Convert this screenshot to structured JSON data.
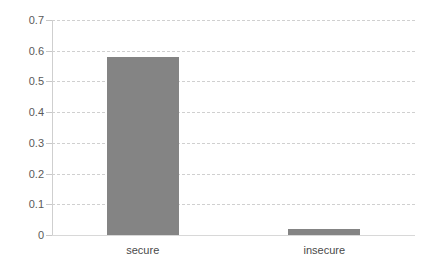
{
  "chart_data": {
    "type": "bar",
    "title": "",
    "subtitle": "",
    "xlabel": "",
    "ylabel": "",
    "categories": [
      "secure",
      "insecure"
    ],
    "values": [
      0.58,
      0.02
    ],
    "series": [
      {
        "name": "proportion",
        "values": [
          0.58,
          0.02
        ],
        "color": "#848484"
      }
    ],
    "ylim": [
      0,
      0.7
    ],
    "ytick_labels": [
      "0",
      "0.1",
      "0.2",
      "0.3",
      "0.4",
      "0.5",
      "0.6",
      "0.7"
    ],
    "ytick_values": [
      0,
      0.1,
      0.2,
      0.3,
      0.4,
      0.5,
      0.6,
      0.7
    ],
    "grid": true,
    "grid_axis": "y",
    "grid_style": "dashed",
    "grid_color": "#d0d0d0",
    "legend": false,
    "legend_position": "none",
    "background": "#ffffff",
    "bar_color": "#848484"
  }
}
